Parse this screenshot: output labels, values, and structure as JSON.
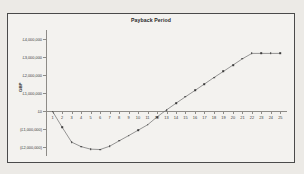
{
  "chart_data": {
    "type": "line",
    "title": "Payback Period",
    "xlabel": "",
    "ylabel": "GBP",
    "x": [
      1,
      2,
      3,
      4,
      5,
      6,
      7,
      8,
      9,
      10,
      11,
      12,
      13,
      14,
      15,
      16,
      17,
      18,
      19,
      20,
      21,
      22,
      23,
      24,
      25
    ],
    "categories": [
      "1",
      "2",
      "3",
      "4",
      "5",
      "6",
      "7",
      "8",
      "9",
      "10",
      "11",
      "12",
      "13",
      "14",
      "15",
      "16",
      "17",
      "18",
      "19",
      "20",
      "21",
      "22",
      "23",
      "24",
      "25"
    ],
    "series": [
      {
        "name": "Cumulative cash flow",
        "values": [
          -30000,
          -900000,
          -1730000,
          -1980000,
          -2120000,
          -2140000,
          -1960000,
          -1660000,
          -1370000,
          -1070000,
          -770000,
          -330000,
          60000,
          430000,
          790000,
          1140000,
          1500000,
          1860000,
          2200000,
          2550000,
          2900000,
          3200000,
          3200000,
          3200000,
          3200000
        ]
      }
    ],
    "ylim": [
      -2500000,
      4500000
    ],
    "yticks": [
      4000000,
      3000000,
      2000000,
      1000000,
      0,
      -1000000,
      -2000000
    ],
    "ytick_labels": [
      "£4,000,000",
      "£3,000,000",
      "£2,000,000",
      "£1,000,000",
      "£0",
      "(£1,000,000)",
      "(£2,000,000)"
    ],
    "xlim": [
      0.3,
      25.7
    ],
    "grid": false,
    "legend": false,
    "marker": "square",
    "line_color": "#6b6b6b",
    "marker_color": "#3d3d3d"
  }
}
